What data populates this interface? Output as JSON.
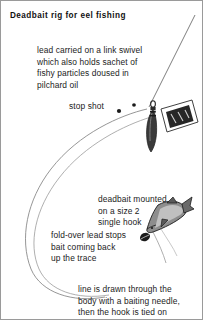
{
  "figure": {
    "title": "Deadbait rig for eel fishing",
    "annotations": {
      "lead_swivel": "lead carried on a link swivel\nwhich also holds sachet of\nfishy particles doused in\npilchard oil",
      "stop_shot": "stop shot",
      "deadbait": "deadbait mounted\non a size 2\nsingle hook",
      "fold_over_lead": "fold-over lead stops\nbait coming back\nup the trace",
      "baiting_needle": "line is drawn through the\nbody with a baiting needle,\nthen the hook is tied on"
    },
    "colors": {
      "ink": "#1b1b1b",
      "line": "#6f6f6f",
      "border": "#9a9a9a",
      "paper": "#ffffff",
      "shade_dark": "#2b2b2b",
      "shade_mid": "#6a6a6a",
      "shade_light": "#c9c9c9"
    }
  }
}
